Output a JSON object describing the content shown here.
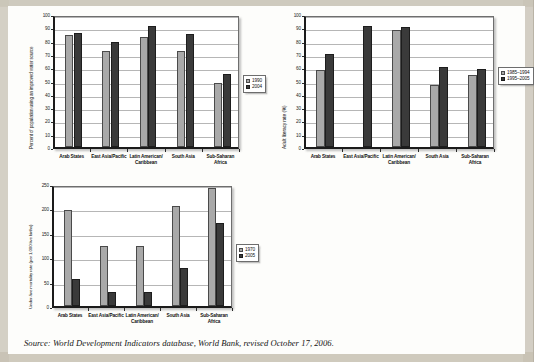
{
  "page": {
    "source_caption": "Source: World Development Indicators database, World Bank, revised October 17, 2006."
  },
  "charts": [
    {
      "id": "water-source-chart",
      "chart_data": {
        "type": "bar",
        "title": "",
        "xlabel": "",
        "ylabel": "Percent of population using an improved water source",
        "ylim": [
          0,
          100
        ],
        "yticks": [
          0,
          10,
          20,
          30,
          40,
          50,
          60,
          70,
          80,
          90,
          100
        ],
        "grid": true,
        "legend_position": "right",
        "categories": [
          "Arab States",
          "East Asia/Pacific",
          "Latin American/ Caribbean",
          "South Asia",
          "Sub-Saharan Africa"
        ],
        "series": [
          {
            "name": "1990",
            "values": [
              84,
              72,
              83,
              72,
              48
            ]
          },
          {
            "name": "2004",
            "values": [
              86,
              79,
              91,
              85,
              55
            ]
          }
        ]
      }
    },
    {
      "id": "adult-literacy-chart",
      "chart_data": {
        "type": "bar",
        "title": "",
        "xlabel": "",
        "ylabel": "Adult literacy rate (%)",
        "ylim": [
          0,
          100
        ],
        "yticks": [
          0,
          10,
          20,
          30,
          40,
          50,
          60,
          70,
          80,
          90,
          100
        ],
        "grid": true,
        "legend_position": "right",
        "categories": [
          "Arab States",
          "East Asia/Pacific",
          "Latin American/ Caribbean",
          "South Asia",
          "Sub-Saharan Africa"
        ],
        "series": [
          {
            "name": "1985–1994",
            "values": [
              58,
              null,
              88,
              47,
              54
            ]
          },
          {
            "name": "1995–2005",
            "values": [
              70,
              91,
              90,
              60,
              59
            ]
          }
        ]
      }
    },
    {
      "id": "under-five-mortality-chart",
      "chart_data": {
        "type": "bar",
        "title": "",
        "xlabel": "",
        "ylabel": "Under-five mortality rate (per 1,000 live births)",
        "ylim": [
          0,
          250
        ],
        "yticks": [
          0,
          50,
          100,
          150,
          200,
          250
        ],
        "grid": true,
        "legend_position": "right",
        "categories": [
          "Arab States",
          "East Asia/Pacific",
          "Latin American/ Caribbean",
          "South Asia",
          "Sub-Saharan Africa"
        ],
        "series": [
          {
            "name": "1970",
            "values": [
              196,
              122,
              122,
              205,
              242
            ]
          },
          {
            "name": "2005",
            "values": [
              56,
              29,
              28,
              77,
              170
            ]
          }
        ]
      }
    }
  ]
}
